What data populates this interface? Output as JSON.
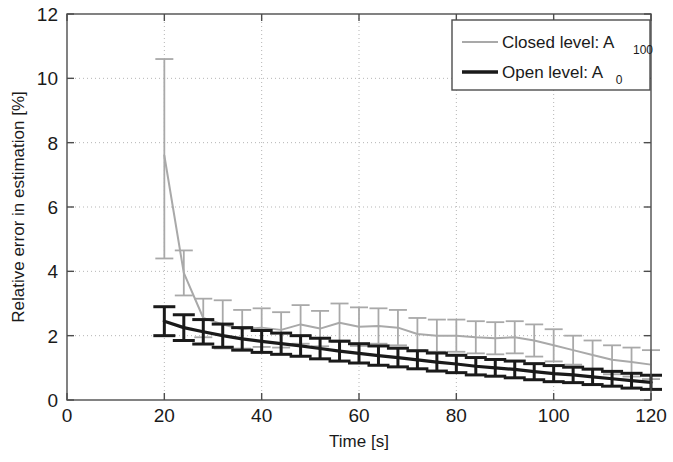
{
  "chart_data": {
    "type": "line",
    "title": "",
    "xlabel": "Time [s]",
    "ylabel": "Relative error in estimation [%]",
    "xlim": [
      0,
      120
    ],
    "ylim": [
      0,
      12
    ],
    "xticks": [
      0,
      20,
      40,
      60,
      80,
      100,
      120
    ],
    "yticks": [
      0,
      2,
      4,
      6,
      8,
      10,
      12
    ],
    "xticklabels": [
      "0",
      "20",
      "40",
      "60",
      "80",
      "100",
      "120"
    ],
    "yticklabels": [
      "0",
      "2",
      "4",
      "6",
      "8",
      "10",
      "12"
    ],
    "grid": true,
    "grid_style": "dotted",
    "legend_position": "top-right",
    "series": [
      {
        "name": "Closed level: A_100",
        "label_main": "Closed level: A",
        "label_sub": "100",
        "color": "#a9a9a9",
        "linewidth": 2.0,
        "x": [
          20,
          24,
          28,
          32,
          36,
          40,
          44,
          48,
          52,
          56,
          60,
          64,
          68,
          72,
          76,
          80,
          84,
          88,
          92,
          96,
          100,
          104,
          108,
          112,
          116,
          120
        ],
        "values": [
          7.6,
          3.95,
          2.55,
          2.35,
          2.2,
          2.25,
          2.18,
          2.35,
          2.22,
          2.4,
          2.28,
          2.3,
          2.25,
          2.05,
          2.0,
          2.0,
          1.95,
          1.92,
          1.95,
          1.85,
          1.7,
          1.55,
          1.4,
          1.25,
          1.18,
          1.1
        ],
        "err_upper": [
          3.0,
          0.7,
          0.6,
          0.75,
          0.6,
          0.6,
          0.55,
          0.6,
          0.55,
          0.6,
          0.6,
          0.55,
          0.55,
          0.5,
          0.5,
          0.5,
          0.5,
          0.5,
          0.5,
          0.5,
          0.5,
          0.45,
          0.45,
          0.45,
          0.45,
          0.45
        ],
        "err_lower": [
          3.2,
          0.7,
          0.6,
          0.75,
          0.6,
          0.6,
          0.55,
          0.6,
          0.55,
          0.6,
          0.6,
          0.55,
          0.55,
          0.5,
          0.5,
          0.5,
          0.5,
          0.5,
          0.5,
          0.5,
          0.5,
          0.45,
          0.45,
          0.45,
          0.45,
          0.45
        ]
      },
      {
        "name": "Open level: A_0",
        "label_main": "Open level: A",
        "label_sub": "0",
        "color": "#1a1a1a",
        "linewidth": 3.2,
        "x": [
          20,
          24,
          28,
          32,
          36,
          40,
          44,
          48,
          52,
          56,
          60,
          64,
          68,
          72,
          76,
          80,
          84,
          88,
          92,
          96,
          100,
          104,
          108,
          112,
          116,
          120
        ],
        "values": [
          2.45,
          2.25,
          2.12,
          2.0,
          1.9,
          1.82,
          1.75,
          1.68,
          1.6,
          1.52,
          1.45,
          1.38,
          1.32,
          1.25,
          1.18,
          1.12,
          1.05,
          1.0,
          0.95,
          0.88,
          0.82,
          0.78,
          0.72,
          0.66,
          0.6,
          0.55
        ],
        "err_upper": [
          0.45,
          0.4,
          0.38,
          0.36,
          0.35,
          0.34,
          0.33,
          0.32,
          0.32,
          0.31,
          0.3,
          0.3,
          0.29,
          0.28,
          0.28,
          0.27,
          0.27,
          0.26,
          0.26,
          0.25,
          0.25,
          0.24,
          0.24,
          0.23,
          0.23,
          0.22
        ],
        "err_lower": [
          0.45,
          0.4,
          0.38,
          0.36,
          0.35,
          0.34,
          0.33,
          0.32,
          0.32,
          0.31,
          0.3,
          0.3,
          0.29,
          0.28,
          0.28,
          0.27,
          0.27,
          0.26,
          0.26,
          0.25,
          0.25,
          0.24,
          0.24,
          0.23,
          0.23,
          0.22
        ]
      }
    ]
  },
  "axes": {
    "xlabel": "Time [s]",
    "ylabel": "Relative error in estimation [%]"
  },
  "legend": {
    "entries": [
      {
        "main": "Closed level: A",
        "sub": "100"
      },
      {
        "main": "Open level: A",
        "sub": "0"
      }
    ]
  },
  "colors": {
    "closed": "#a9a9a9",
    "open": "#1a1a1a",
    "axis": "#4d4d4d",
    "grid": "#b5b5b5",
    "background": "#ffffff"
  }
}
